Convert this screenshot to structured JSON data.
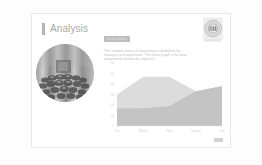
{
  "slide": {
    "title": "Analysis",
    "accent_color": "#b4b4b4",
    "title_color": "#a9a9a9",
    "card_background": "#ffffff",
    "card_border_color": "#e9e9e9",
    "page_background": "#fdfdfd"
  },
  "logo": {
    "icon_name": "circular-emblem-logo",
    "label": "LTD"
  },
  "photo": {
    "icon_name": "circular-photo-pinecones",
    "alt": "Grayscale photograph of clustered pine cones"
  },
  "description": {
    "badge_label": "Description",
    "badge_color": "#bdbdbd",
    "body_lines": [
      "This analysis covers all departments and defines the",
      "managers and supervisors. The shown graph is the basic",
      "departmental division by segments."
    ]
  },
  "footer": {
    "marker_name": "page-number-marker"
  },
  "chart_data": {
    "type": "area",
    "title": "",
    "xlabel": "",
    "ylabel": "",
    "grid": false,
    "legend_position": "none",
    "stacked": false,
    "categories": [
      "Jan",
      "March",
      "May",
      "October",
      "July"
    ],
    "x": [
      0,
      1,
      2,
      3,
      4
    ],
    "ylim": [
      0,
      60
    ],
    "yticks": [
      0,
      10,
      20,
      30,
      40,
      50,
      60
    ],
    "ytick_labels": [
      "0",
      "10",
      "20",
      "30",
      "40",
      "50",
      "60"
    ],
    "series": [
      {
        "name": "Series A",
        "color": "#dcdcdc",
        "values": [
          30,
          47,
          47,
          33,
          22
        ]
      },
      {
        "name": "Series B",
        "color": "#c4c4c4",
        "values": [
          17,
          17,
          19,
          33,
          38
        ]
      }
    ]
  }
}
